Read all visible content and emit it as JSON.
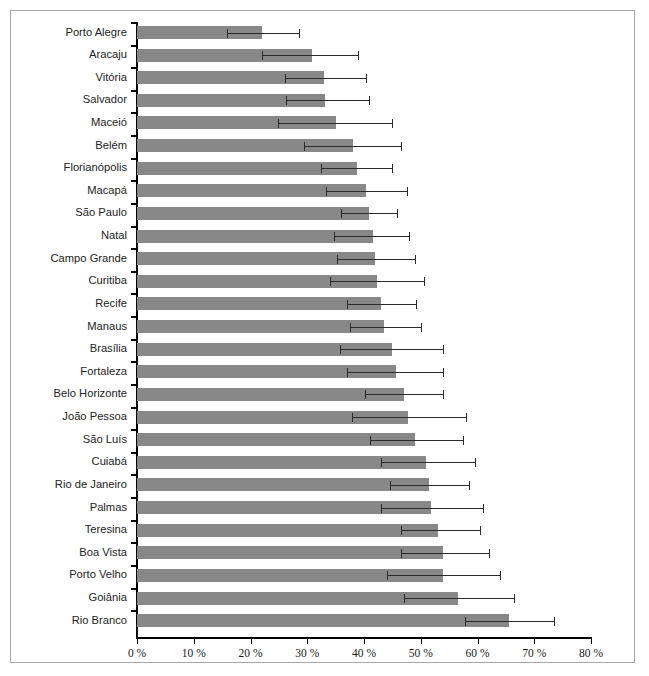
{
  "chart_data": {
    "type": "bar",
    "orientation": "horizontal",
    "title": "",
    "subtitle": "",
    "xlabel": "",
    "ylabel": "",
    "xlim": [
      0,
      80
    ],
    "xtick_labels": [
      "0 %",
      "10 %",
      "20 %",
      "30 %",
      "40 %",
      "50 %",
      "60 %",
      "70 %",
      "80 %"
    ],
    "xtick_values": [
      0,
      10,
      20,
      30,
      40,
      50,
      60,
      70,
      80
    ],
    "grid": false,
    "legend": null,
    "bar_color": "#888888",
    "error_color": "#2b2b2b",
    "error_bars": true,
    "categories": [
      "Porto Alegre",
      "Aracaju",
      "Vitória",
      "Salvador",
      "Maceió",
      "Belém",
      "Florianópolis",
      "Macapá",
      "São Paulo",
      "Natal",
      "Campo Grande",
      "Curitiba",
      "Recife",
      "Manaus",
      "Brasília",
      "Fortaleza",
      "Belo Horizonte",
      "João Pessoa",
      "São Luís",
      "Cuiabá",
      "Rio de Janeiro",
      "Palmas",
      "Teresina",
      "Boa Vista",
      "Porto Velho",
      "Goiânia",
      "Rio Branco"
    ],
    "values": [
      22.0,
      30.8,
      33.0,
      33.2,
      35.0,
      38.0,
      38.7,
      40.3,
      40.8,
      41.5,
      42.0,
      42.3,
      43.0,
      43.6,
      45.0,
      45.6,
      47.0,
      47.8,
      49.0,
      51.0,
      51.5,
      51.8,
      53.0,
      54.0,
      54.0,
      56.5,
      65.5
    ],
    "ci_low": [
      15.8,
      22.0,
      26.0,
      26.3,
      24.8,
      29.4,
      32.5,
      33.3,
      36.0,
      34.8,
      35.2,
      34.0,
      37.0,
      37.5,
      35.8,
      37.0,
      40.2,
      37.8,
      41.0,
      43.0,
      44.5,
      43.0,
      46.5,
      46.5,
      44.0,
      47.0,
      57.8
    ],
    "ci_high": [
      28.5,
      39.0,
      40.4,
      40.8,
      45.0,
      46.5,
      45.0,
      47.5,
      45.8,
      48.0,
      49.0,
      50.5,
      49.2,
      50.0,
      54.0,
      54.0,
      54.0,
      58.0,
      57.5,
      59.5,
      58.5,
      61.0,
      60.5,
      62.0,
      64.0,
      66.5,
      73.5
    ]
  }
}
